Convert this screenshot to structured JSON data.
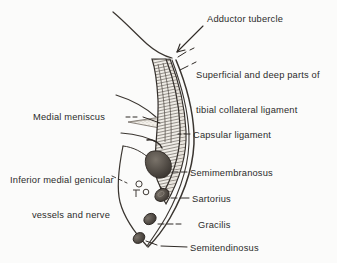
{
  "figure": {
    "background_color": "#fbfbfa",
    "ink_color": "#2b2b2b"
  },
  "labels": [
    {
      "id": "adductor-tubercle",
      "text": "Adductor tubercle",
      "lines": [
        "Adductor tubercle"
      ],
      "x": 207,
      "y": 14,
      "align": "left"
    },
    {
      "id": "tibial-collateral-ligament",
      "text": "Superficial and deep parts of tibial collateral ligament",
      "lines": [
        "Superficial and deep parts of",
        "tibial collateral ligament"
      ],
      "x": 196,
      "y": 47,
      "align": "left"
    },
    {
      "id": "medial-meniscus",
      "text": "Medial meniscus",
      "lines": [
        "Medial meniscus"
      ],
      "x": 33,
      "y": 112,
      "align": "left"
    },
    {
      "id": "capsular-ligament",
      "text": "Capsular ligament",
      "lines": [
        "Capsular ligament"
      ],
      "x": 193,
      "y": 130,
      "align": "left"
    },
    {
      "id": "inferior-medial-genicular",
      "text": "Inferior medial genicular vessels and nerve",
      "lines": [
        "Inferior medial genicular",
        "vessels and nerve"
      ],
      "x": 10,
      "y": 152,
      "align": "right"
    },
    {
      "id": "semimembranosus",
      "text": "Semimembranosus",
      "lines": [
        "Semimembranosus"
      ],
      "x": 190,
      "y": 168,
      "align": "left"
    },
    {
      "id": "sartorius",
      "text": "Sartorius",
      "lines": [
        "Sartorius"
      ],
      "x": 192,
      "y": 194,
      "align": "left"
    },
    {
      "id": "gracilis",
      "text": "Gracilis",
      "lines": [
        "Gracilis"
      ],
      "x": 198,
      "y": 220,
      "align": "left"
    },
    {
      "id": "semitendinosus",
      "text": "Semitendinosus",
      "lines": [
        "Semitendinosus"
      ],
      "x": 190,
      "y": 243,
      "align": "left"
    }
  ],
  "structures": [
    {
      "id": "femur-outline",
      "name": "femur medial condyle outline"
    },
    {
      "id": "tibia-outline",
      "name": "tibia medial surface outline"
    },
    {
      "id": "superficial-tibial-collateral-band",
      "name": "superficial part of tibial collateral ligament"
    },
    {
      "id": "deep-tibial-collateral-band",
      "name": "deep part of tibial collateral ligament"
    },
    {
      "id": "capsular-ligament-band",
      "name": "capsular ligament"
    },
    {
      "id": "medial-meniscus-wedge",
      "name": "medial meniscus"
    },
    {
      "id": "semimembranosus-tendon",
      "name": "semimembranosus tendon"
    },
    {
      "id": "sartorius-tendon",
      "name": "sartorius tendon"
    },
    {
      "id": "gracilis-tendon",
      "name": "gracilis tendon"
    },
    {
      "id": "semitendinosus-tendon",
      "name": "semitendinosus tendon"
    },
    {
      "id": "genicular-vessels",
      "name": "inferior medial genicular vessels and nerve"
    }
  ]
}
